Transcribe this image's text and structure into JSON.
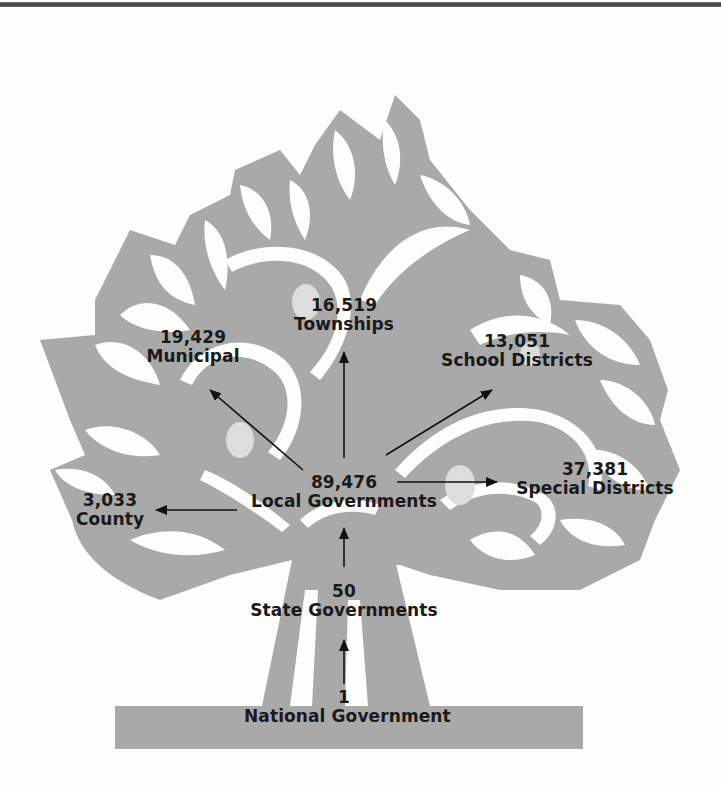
{
  "colors": {
    "tree": "#a9a9a9",
    "knot": "#dddddd",
    "background": "#fdfdfc",
    "text": "#1a1a1a",
    "rule": "#4a4a4a"
  },
  "diagram": {
    "type": "hierarchy-tree",
    "nodes": [
      {
        "id": "national",
        "count": "1",
        "label": "National Government"
      },
      {
        "id": "state",
        "count": "50",
        "label": "State Governments"
      },
      {
        "id": "local",
        "count": "89,476",
        "label": "Local Governments"
      },
      {
        "id": "county",
        "count": "3,033",
        "label": "County"
      },
      {
        "id": "municipal",
        "count": "19,429",
        "label": "Municipal"
      },
      {
        "id": "townships",
        "count": "16,519",
        "label": "Townships"
      },
      {
        "id": "school",
        "count": "13,051",
        "label": "School Districts"
      },
      {
        "id": "special",
        "count": "37,381",
        "label": "Special Districts"
      }
    ],
    "edges": [
      {
        "from": "national",
        "to": "state"
      },
      {
        "from": "state",
        "to": "local"
      },
      {
        "from": "local",
        "to": "county"
      },
      {
        "from": "local",
        "to": "municipal"
      },
      {
        "from": "local",
        "to": "townships"
      },
      {
        "from": "local",
        "to": "school"
      },
      {
        "from": "local",
        "to": "special"
      }
    ]
  }
}
